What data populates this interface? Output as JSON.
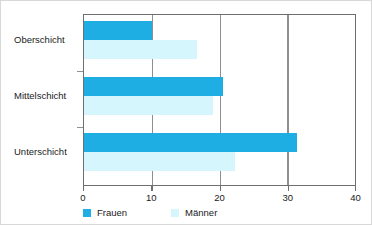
{
  "chart_data": {
    "type": "bar",
    "orientation": "horizontal",
    "title": "",
    "subtitle": "",
    "xlabel": "",
    "ylabel": "",
    "categories": [
      "Oberschicht",
      "Mittelschicht",
      "Unterschicht"
    ],
    "series": [
      {
        "name": "Frauen",
        "color": "#1faee3",
        "values": [
          10.0,
          20.5,
          31.4
        ]
      },
      {
        "name": "Männer",
        "color": "#d5f6fd",
        "values": [
          16.7,
          19.0,
          22.3
        ]
      }
    ],
    "xlim": [
      0,
      40
    ],
    "xticks": [
      0,
      10,
      20,
      30,
      40
    ],
    "xtick_labels": [
      "0",
      "10",
      "20",
      "30",
      "40"
    ],
    "grid": true,
    "grid_axis": "x",
    "legend": [
      "Frauen",
      "Männer"
    ],
    "legend_position": "bottom-left",
    "annotations": []
  },
  "legend": {
    "frauen_label": "Frauen",
    "maenner_label": "Männer"
  },
  "axis": {
    "tick_0": "0",
    "tick_10": "10",
    "tick_20": "20",
    "tick_30": "30",
    "tick_40": "40"
  },
  "categories": {
    "oberschicht": "Oberschicht",
    "mittelschicht": "Mittelschicht",
    "unterschicht": "Unterschicht"
  },
  "colors": {
    "frauen": "#1faee3",
    "maenner": "#d5f6fd",
    "axis": "#6f6f6f",
    "grid": "#8e8e8e",
    "border": "#d8d8d8",
    "text": "#1a1a1a",
    "background": "#ffffff"
  }
}
